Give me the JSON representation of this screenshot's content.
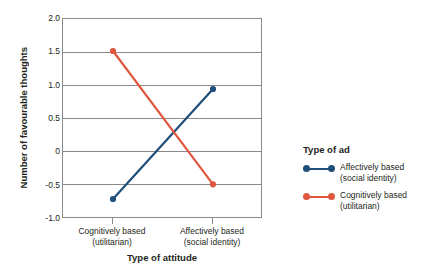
{
  "chart_data": {
    "type": "line",
    "title": "",
    "xlabel": "Type of attitude",
    "ylabel": "Number of favourable thoughts",
    "categories": [
      "Cognitively based\n(utilitarian)",
      "Affectively based\n(social identity)"
    ],
    "category_lines": [
      [
        "Cognitively based",
        "(utilitarian)"
      ],
      [
        "Affectively based",
        "(social identity)"
      ]
    ],
    "ylim": [
      -1.0,
      2.0
    ],
    "yticks": [
      "2.0",
      "1.5",
      "1.0",
      "0.5",
      "0",
      "-0.5",
      "-1.0"
    ],
    "ytick_values": [
      2.0,
      1.5,
      1.0,
      0.5,
      0,
      -0.5,
      -1.0
    ],
    "grid": true,
    "legend_position": "right",
    "legend_title": "Type of ad",
    "series": [
      {
        "name": "Affectively based (social identity)",
        "name_lines": [
          "Affectively based",
          "(social identity)"
        ],
        "color": "#1F4E79",
        "values": [
          -0.7,
          0.95
        ]
      },
      {
        "name": "Cognitively based (utilitarian)",
        "name_lines": [
          "Cognitively based",
          "(utilitarian)"
        ],
        "color": "#E0573F",
        "values": [
          1.52,
          -0.48
        ]
      }
    ]
  },
  "colors": {
    "blue": "#1F4E79",
    "red": "#E0573F",
    "axis": "#8a8a8d",
    "text": "#231f20",
    "background": "#ffffff"
  }
}
